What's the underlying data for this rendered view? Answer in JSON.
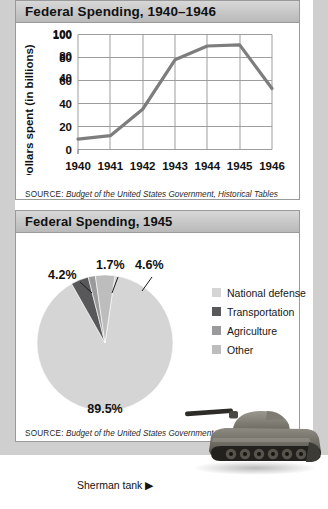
{
  "charts": [
    {
      "title": "Federal Spending, 1940–1946",
      "source_label": "SOURCE:",
      "source_text": "Budget of the United States Government, Historical Tables"
    },
    {
      "title": "Federal Spending, 1945",
      "source_label": "SOURCE:",
      "source_text": "Budget of the United States Government, Historical Tables"
    }
  ],
  "caption": "Sherman tank ▶",
  "chart_data": [
    {
      "type": "line",
      "title": "Federal Spending, 1940–1946",
      "xlabel": "",
      "ylabel": "Dollars spent (in billions)",
      "categories": [
        "1940",
        "1941",
        "1942",
        "1943",
        "1944",
        "1945",
        "1946"
      ],
      "values": [
        9,
        12,
        35,
        78,
        90,
        91,
        53
      ],
      "yticks": [
        0,
        20,
        40,
        60,
        80,
        100
      ],
      "ylim": [
        0,
        100
      ],
      "grid": true,
      "legend": "none",
      "line_color": "#7d7d7d"
    },
    {
      "type": "pie",
      "title": "Federal Spending, 1945",
      "labels": [
        "National defense",
        "Transportation",
        "Agriculture",
        "Other"
      ],
      "values": [
        89.5,
        4.2,
        1.7,
        4.6
      ],
      "value_labels": [
        "89.5%",
        "4.2%",
        "1.7%",
        "4.6%"
      ],
      "colors": [
        "#d5d5d5",
        "#58585a",
        "#9a9a9c",
        "#bdbdbd"
      ],
      "legend": "right"
    }
  ]
}
